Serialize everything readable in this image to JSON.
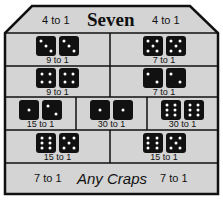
{
  "colors": {
    "background": "#ffffff",
    "table_fill": "#d4d4d4",
    "line": "#111111",
    "die_body": "#111111",
    "pip": "#ffffff"
  },
  "header": {
    "title": "Seven",
    "left_odds": "4 to 1",
    "right_odds": "4 to 1"
  },
  "rows": [
    {
      "cells": [
        {
          "name": "hard-six",
          "dice": [
            3,
            3
          ],
          "odds": "9 to 1"
        },
        {
          "name": "hard-ten",
          "dice": [
            5,
            5
          ],
          "odds": "7 to 1"
        }
      ]
    },
    {
      "cells": [
        {
          "name": "hard-eight",
          "dice": [
            4,
            4
          ],
          "odds": "9 to 1"
        },
        {
          "name": "hard-four",
          "dice": [
            2,
            2
          ],
          "odds": "7 to 1"
        }
      ]
    },
    {
      "cells": [
        {
          "name": "ace-deuce",
          "dice": [
            1,
            2
          ],
          "odds": "15 to 1"
        },
        {
          "name": "aces",
          "dice": [
            1,
            1
          ],
          "odds": "30 to 1"
        },
        {
          "name": "twelve",
          "dice": [
            6,
            6
          ],
          "odds": "30 to 1"
        }
      ]
    },
    {
      "cells": [
        {
          "name": "yo-eleven-left",
          "dice": [
            6,
            5
          ],
          "odds": "15 to 1"
        },
        {
          "name": "yo-eleven-right",
          "dice": [
            6,
            5
          ],
          "odds": "15 to 1"
        }
      ]
    }
  ],
  "footer": {
    "title": "Any Craps",
    "left_odds": "7 to 1",
    "right_odds": "7 to 1"
  }
}
